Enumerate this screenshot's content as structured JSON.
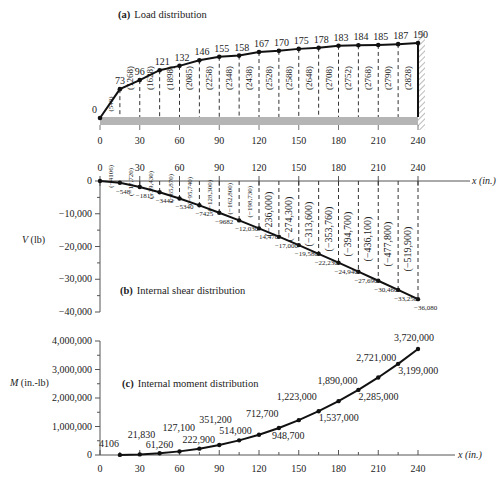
{
  "chart_data": [
    {
      "panel": "a",
      "type": "line",
      "title": "(a) Load distribution",
      "title_prefix": "(a)",
      "title_text": "Load distribution",
      "xlabel": "",
      "x": [
        0,
        15,
        30,
        45,
        60,
        75,
        90,
        105,
        120,
        135,
        150,
        165,
        180,
        195,
        210,
        225,
        240
      ],
      "values": [
        0,
        73,
        96,
        121,
        132,
        146,
        155,
        158,
        167,
        170,
        175,
        178,
        183,
        184,
        185,
        187,
        190
      ],
      "segment_labels": [
        "(548)",
        "(1268)",
        "(1628)",
        "(1898)",
        "(2085)",
        "(2258)",
        "(2348)",
        "(2438)",
        "(2528)",
        "(2588)",
        "(2648)",
        "(2708)",
        "(2752)",
        "(2768)",
        "(2790)",
        "(2828)"
      ],
      "x_ticks": [
        "0",
        "30",
        "60",
        "90",
        "120",
        "150",
        "180",
        "210",
        "240"
      ],
      "support": "fixed wall at x = 240"
    },
    {
      "panel": "b",
      "type": "line",
      "title": "(b) Internal shear distribution",
      "title_prefix": "(b)",
      "title_text": "Internal shear distribution",
      "xlabel": "x (in.)",
      "ylabel": "V (lb)",
      "ylim": [
        -40000,
        0
      ],
      "y_ticks": [
        "0",
        "−10,000",
        "−20,000",
        "−30,000",
        "−40,000"
      ],
      "x_ticks": [
        "0",
        "30",
        "60",
        "90",
        "120",
        "150",
        "180",
        "210",
        "240"
      ],
      "x": [
        0,
        15,
        30,
        45,
        60,
        75,
        90,
        105,
        120,
        135,
        150,
        165,
        180,
        195,
        210,
        225,
        240
      ],
      "values": [
        0,
        -548,
        -1815,
        -3442,
        -5340,
        -7425,
        -9682,
        -12030,
        -14470,
        -17000,
        -19580,
        -22230,
        -24940,
        -27690,
        -30460,
        -33250,
        -36080
      ],
      "point_labels": [
        "",
        "−548",
        "−1815",
        "−3442",
        "−5340",
        "−7425",
        "−9682",
        "−12,030",
        "−14,470",
        "−17,000",
        "−19,580",
        "−22,230",
        "−24,940",
        "−27,690",
        "−30,460",
        "−33,250",
        "−36,080"
      ],
      "segment_labels": [
        "(−4106)",
        "(−17,720)",
        "(−39,430)",
        "(−65,870)",
        "(−95,740)",
        "(−128,300)",
        "(−162,800)",
        "(−198,730)",
        "(−236,000)",
        "(−274,300)",
        "(−313,600)",
        "(−353,760)",
        "(−394,700)",
        "(−436,100)",
        "(−477,800)",
        "(−519,900)"
      ]
    },
    {
      "panel": "c",
      "type": "line",
      "title": "(c) Internal moment distribution",
      "title_prefix": "(c)",
      "title_text": "Internal moment distribution",
      "xlabel": "x (in.)",
      "ylabel": "M (in.-lb)",
      "ylim": [
        0,
        4000000
      ],
      "y_ticks": [
        "0",
        "1,000,000",
        "2,000,000",
        "3,000,000",
        "4,000,000"
      ],
      "x_ticks": [
        "0",
        "30",
        "60",
        "90",
        "120",
        "150",
        "180",
        "210",
        "240"
      ],
      "x": [
        15,
        30,
        45,
        60,
        75,
        90,
        105,
        120,
        135,
        150,
        165,
        180,
        195,
        210,
        225,
        240
      ],
      "values": [
        4106,
        21830,
        61260,
        127100,
        222900,
        351200,
        514000,
        712700,
        948700,
        1223000,
        1537000,
        1890000,
        2285000,
        2721000,
        3199000,
        3720000
      ],
      "point_labels": [
        "4106",
        "21,830",
        "61,260",
        "127,100",
        "222,900",
        "351,200",
        "514,000",
        "712,700",
        "948,700",
        "1,223,000",
        "1,537,000",
        "1,890,000",
        "2,285,000",
        "2,721,000",
        "3,199,000",
        "3,720,000"
      ]
    }
  ]
}
